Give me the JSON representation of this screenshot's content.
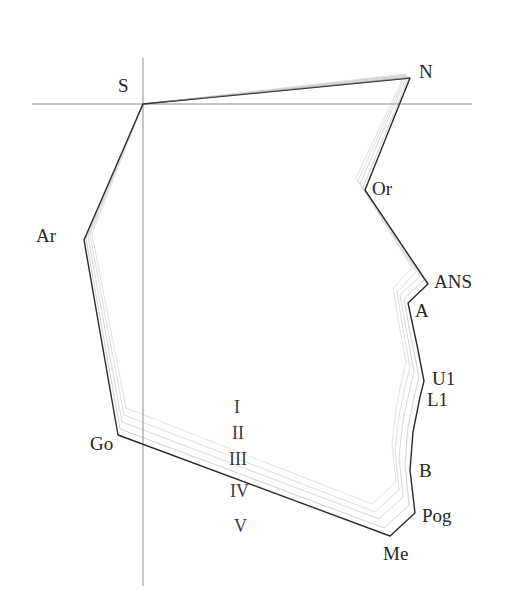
{
  "figure": {
    "type": "cephalometric-superimposition-tracing",
    "title_fragment": "",
    "background_color": "#ffffff",
    "line_color": "#2b2b2b",
    "ghost_color": "#d8d8d8",
    "axis_color": "#8f8f8f"
  },
  "axes": {
    "horizontal": {
      "name": "sella-nasion-horizontal-reference",
      "y": 104,
      "x1": 32,
      "x2": 472
    },
    "vertical": {
      "name": "vertical-reference",
      "x": 143,
      "y1": 58,
      "y2": 586
    }
  },
  "landmarks": [
    {
      "id": "S",
      "label": "S",
      "x": 143,
      "y": 104,
      "label_x": 118,
      "label_y": 76
    },
    {
      "id": "N",
      "label": "N",
      "x": 410,
      "y": 78,
      "label_x": 419,
      "label_y": 62
    },
    {
      "id": "Or",
      "label": "Or",
      "x": 365,
      "y": 190,
      "label_x": 372,
      "label_y": 179
    },
    {
      "id": "ANS",
      "label": "ANS",
      "x": 428,
      "y": 284,
      "label_x": 434,
      "label_y": 272
    },
    {
      "id": "A",
      "label": "A",
      "x": 408,
      "y": 303,
      "label_x": 415,
      "label_y": 301
    },
    {
      "id": "U1",
      "label": "U1",
      "x": 424,
      "y": 381,
      "label_x": 432,
      "label_y": 369
    },
    {
      "id": "L1",
      "label": "L1",
      "x": 420,
      "y": 397,
      "label_x": 427,
      "label_y": 390
    },
    {
      "id": "B",
      "label": "B",
      "x": 410,
      "y": 470,
      "label_x": 419,
      "label_y": 461
    },
    {
      "id": "Pog",
      "label": "Pog",
      "x": 415,
      "y": 513,
      "label_x": 422,
      "label_y": 506
    },
    {
      "id": "Me",
      "label": "Me",
      "x": 390,
      "y": 536,
      "label_x": 383,
      "label_y": 544
    },
    {
      "id": "Go",
      "label": "Go",
      "x": 118,
      "y": 435,
      "label_x": 90,
      "label_y": 434
    },
    {
      "id": "Ar",
      "label": "Ar",
      "x": 84,
      "y": 240,
      "label_x": 36,
      "label_y": 226
    }
  ],
  "stage_markers": [
    {
      "label": "I",
      "x": 234,
      "y": 398
    },
    {
      "label": "II",
      "x": 232,
      "y": 424
    },
    {
      "label": "III",
      "x": 229,
      "y": 450
    },
    {
      "label": "IV",
      "x": 230,
      "y": 482
    },
    {
      "label": "V",
      "x": 234,
      "y": 517
    }
  ],
  "main_outline": {
    "name": "stage-v-outline",
    "points": "143,104 410,78 365,190 428,284 408,303 417,345 424,381 420,397 413,432 410,470 415,513 390,536 118,435 84,240 143,104"
  },
  "ghost_outlines": [
    {
      "name": "stage-i-outline",
      "points": "143,104 405,74 356,178 412,268 393,288 400,330 406,362 402,378 396,410 392,444 396,482 372,504 126,408 92,234 143,104"
    },
    {
      "name": "stage-ii-outline",
      "points": "143,104 406,75 358,181 416,272 397,292 404,335 410,367 406,383 399,416 395,451 399,490 375,512 124,415 90,235 143,104"
    },
    {
      "name": "stage-iii-outline",
      "points": "143,104 407,76 360,184 420,276 400,295 408,339 414,372 410,388 403,421 399,457 403,497 379,519 122,422 88,237 143,104"
    },
    {
      "name": "stage-iv-outline",
      "points": "143,104 409,77 363,187 424,280 404,299 412,342 419,377 415,393 408,427 405,464 409,505 384,528 120,429 86,239 143,104"
    }
  ],
  "corner_mark": {
    "text": "",
    "x": 28,
    "y": 2
  }
}
